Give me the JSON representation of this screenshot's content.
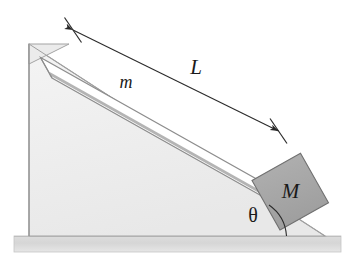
{
  "figure": {
    "type": "physics-free-body-diagram",
    "labels": {
      "length_label": "L",
      "plank_mass_label": "m",
      "block_mass_label": "M",
      "angle_label": "θ"
    },
    "colors": {
      "wedge_fill": "#efefef",
      "wedge_stroke": "#9a9a9a",
      "ground_fill": "#d9d9d9",
      "ground_stroke": "#c0c0c0",
      "plank_fill": "#ffffff",
      "plank_stroke": "#8d8d8d",
      "plank_center_line": "#b0b0b0",
      "block_fill": "#a9a9a9",
      "block_stroke": "#6e6e6e",
      "dimension_line": "#333333",
      "text": "#1a1a1a"
    },
    "geometry": {
      "incline_angle_degrees": 26,
      "wedge_apex": [
        29,
        44
      ],
      "wedge_bottom_left": [
        29,
        236
      ],
      "wedge_bottom_right": [
        325,
        236
      ],
      "dimension_start": [
        73,
        30
      ],
      "dimension_end": [
        278,
        131
      ],
      "ground_top_y": 236,
      "ground_bottom_y": 252,
      "ground_left_x": 14,
      "ground_right_x": 341
    }
  }
}
